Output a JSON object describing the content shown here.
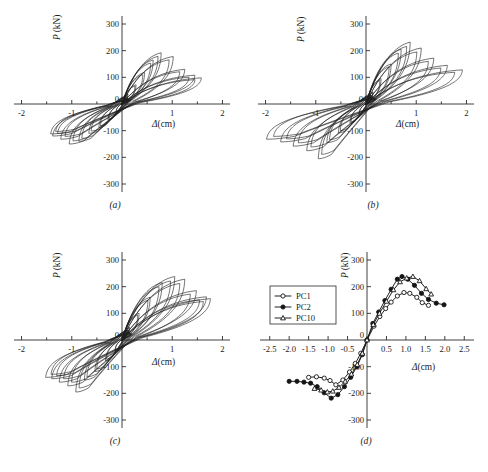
{
  "figure": {
    "background": "#ffffff",
    "ink_color": "#1a1a1a",
    "panels": [
      {
        "id": "a",
        "label": "(a)"
      },
      {
        "id": "b",
        "label": "(b)"
      },
      {
        "id": "c",
        "label": "(c)"
      },
      {
        "id": "d",
        "label": "(d)"
      }
    ]
  },
  "axes": {
    "y_title_symbol": "P",
    "y_title_unit": "(kN)",
    "x_title_symbol": "Δ",
    "x_title_unit": "(cm)",
    "hysteresis": {
      "x_ticks": [
        "-2",
        "-1",
        "0",
        "1",
        "2"
      ],
      "x_tick_values": [
        -2,
        -1,
        0,
        1,
        2
      ],
      "x_minor_values": [
        -1.5,
        -0.5,
        0.5,
        1.5
      ],
      "y_ticks": [
        "300",
        "200",
        "100",
        "0",
        "-100",
        "-200",
        "-300"
      ],
      "y_tick_values": [
        300,
        200,
        100,
        0,
        -100,
        -200,
        -300
      ],
      "xlim": [
        -2.15,
        2.15
      ],
      "ylim": [
        -330,
        330
      ]
    },
    "skeleton": {
      "x_ticks": [
        "-2.5",
        "-2.0",
        "-1.5",
        "-1.0",
        "-0.5",
        "0",
        "0.5",
        "1.0",
        "1.5",
        "2.0",
        "2.5"
      ],
      "x_tick_values": [
        -2.5,
        -2.0,
        -1.5,
        -1.0,
        -0.5,
        0,
        0.5,
        1.0,
        1.5,
        2.0,
        2.5
      ],
      "y_ticks": [
        "300",
        "200",
        "100",
        "0",
        "-100",
        "-200",
        "-300"
      ],
      "y_tick_values": [
        300,
        200,
        100,
        0,
        -100,
        -200,
        -300
      ],
      "xlim": [
        -2.75,
        2.75
      ],
      "ylim": [
        -330,
        330
      ]
    }
  },
  "chart_data": [
    {
      "type": "line",
      "panel": "a",
      "title": "(a)",
      "xlabel": "Δ(cm)",
      "ylabel": "P (kN)",
      "xlim": [
        -2.15,
        2.15
      ],
      "ylim": [
        -330,
        330
      ],
      "grid": false,
      "legend": "none",
      "description": "Load-displacement hysteresis loops, specimen PC1",
      "loops": [
        {
          "cycle": 1,
          "peak_pos": [
            0.12,
            38
          ],
          "peak_neg": [
            -0.12,
            -32
          ]
        },
        {
          "cycle": 2,
          "peak_pos": [
            0.28,
            72
          ],
          "peak_neg": [
            -0.28,
            -60
          ]
        },
        {
          "cycle": 3,
          "peak_pos": [
            0.45,
            118
          ],
          "peak_neg": [
            -0.46,
            -88
          ]
        },
        {
          "cycle": 4,
          "peak_pos": [
            0.62,
            165
          ],
          "peak_neg": [
            -0.66,
            -110
          ]
        },
        {
          "cycle": 5,
          "peak_pos": [
            0.78,
            192
          ],
          "peak_neg": [
            -0.86,
            -140
          ]
        },
        {
          "cycle": 6,
          "peak_pos": [
            1.02,
            178
          ],
          "peak_neg": [
            -1.05,
            -150
          ]
        },
        {
          "cycle": 7,
          "peak_pos": [
            1.25,
            130
          ],
          "peak_neg": [
            -1.22,
            -132
          ]
        },
        {
          "cycle": 8,
          "peak_pos": [
            1.45,
            108
          ],
          "peak_neg": [
            -1.38,
            -120
          ]
        },
        {
          "cycle": 9,
          "peak_pos": [
            1.58,
            98
          ],
          "peak_neg": [
            -1.42,
            -112
          ]
        }
      ]
    },
    {
      "type": "line",
      "panel": "b",
      "title": "(b)",
      "xlabel": "Δ(cm)",
      "ylabel": "P (kN)",
      "xlim": [
        -2.15,
        2.15
      ],
      "ylim": [
        -330,
        330
      ],
      "grid": false,
      "legend": "none",
      "description": "Load-displacement hysteresis loops, specimen PC2",
      "loops": [
        {
          "cycle": 1,
          "peak_pos": [
            0.14,
            45
          ],
          "peak_neg": [
            -0.14,
            -40
          ]
        },
        {
          "cycle": 2,
          "peak_pos": [
            0.3,
            95
          ],
          "peak_neg": [
            -0.32,
            -72
          ]
        },
        {
          "cycle": 3,
          "peak_pos": [
            0.5,
            150
          ],
          "peak_neg": [
            -0.55,
            -108
          ]
        },
        {
          "cycle": 4,
          "peak_pos": [
            0.7,
            205
          ],
          "peak_neg": [
            -0.78,
            -145
          ]
        },
        {
          "cycle": 5,
          "peak_pos": [
            0.88,
            232
          ],
          "peak_neg": [
            -0.95,
            -205
          ]
        },
        {
          "cycle": 6,
          "peak_pos": [
            1.1,
            210
          ],
          "peak_neg": [
            -1.18,
            -175
          ]
        },
        {
          "cycle": 7,
          "peak_pos": [
            1.35,
            172
          ],
          "peak_neg": [
            -1.45,
            -158
          ]
        },
        {
          "cycle": 8,
          "peak_pos": [
            1.62,
            145
          ],
          "peak_neg": [
            -1.7,
            -142
          ]
        },
        {
          "cycle": 9,
          "peak_pos": [
            1.92,
            128
          ],
          "peak_neg": [
            -1.98,
            -132
          ]
        }
      ]
    },
    {
      "type": "line",
      "panel": "c",
      "title": "(c)",
      "xlabel": "Δ(cm)",
      "ylabel": "P (kN)",
      "xlim": [
        -2.15,
        2.15
      ],
      "ylim": [
        -330,
        330
      ],
      "grid": false,
      "legend": "none",
      "description": "Load-displacement hysteresis loops, specimen PC10",
      "loops": [
        {
          "cycle": 1,
          "peak_pos": [
            0.15,
            48
          ],
          "peak_neg": [
            -0.14,
            -42
          ]
        },
        {
          "cycle": 2,
          "peak_pos": [
            0.34,
            100
          ],
          "peak_neg": [
            -0.33,
            -78
          ]
        },
        {
          "cycle": 3,
          "peak_pos": [
            0.56,
            160
          ],
          "peak_neg": [
            -0.54,
            -118
          ]
        },
        {
          "cycle": 4,
          "peak_pos": [
            0.8,
            215
          ],
          "peak_neg": [
            -0.75,
            -150
          ]
        },
        {
          "cycle": 5,
          "peak_pos": [
            1.05,
            238
          ],
          "peak_neg": [
            -0.92,
            -195
          ]
        },
        {
          "cycle": 6,
          "peak_pos": [
            1.25,
            228
          ],
          "peak_neg": [
            -1.08,
            -172
          ]
        },
        {
          "cycle": 7,
          "peak_pos": [
            1.48,
            185
          ],
          "peak_neg": [
            -1.25,
            -158
          ]
        },
        {
          "cycle": 8,
          "peak_pos": [
            1.68,
            162
          ],
          "peak_neg": [
            -1.4,
            -145
          ]
        },
        {
          "cycle": 9,
          "peak_pos": [
            1.76,
            155
          ],
          "peak_neg": [
            -1.52,
            -140
          ]
        }
      ]
    },
    {
      "type": "line",
      "panel": "d",
      "title": "(d)",
      "xlabel": "Δ(cm)",
      "ylabel": "P (kN)",
      "xlim": [
        -2.75,
        2.75
      ],
      "ylim": [
        -330,
        330
      ],
      "grid": false,
      "legend": "top-left",
      "description": "Skeleton (envelope) curves comparison of PC1, PC2 and PC10",
      "series": [
        {
          "name": "PC1",
          "marker": "open-circle",
          "x": [
            -1.5,
            -1.3,
            -1.1,
            -0.95,
            -0.8,
            -0.62,
            -0.45,
            -0.3,
            -0.16,
            0,
            0.18,
            0.33,
            0.48,
            0.62,
            0.78,
            0.95,
            1.1,
            1.28,
            1.42,
            1.58
          ],
          "y": [
            -140,
            -138,
            -143,
            -152,
            -168,
            -150,
            -120,
            -88,
            -50,
            0,
            52,
            88,
            118,
            142,
            165,
            178,
            175,
            160,
            140,
            130
          ]
        },
        {
          "name": "PC2",
          "marker": "filled-circle",
          "x": [
            -2.0,
            -1.8,
            -1.62,
            -1.45,
            -1.28,
            -1.1,
            -0.92,
            -0.75,
            -0.58,
            -0.42,
            -0.26,
            -0.12,
            0,
            0.15,
            0.3,
            0.46,
            0.62,
            0.78,
            0.9,
            1.05,
            1.22,
            1.4,
            1.58,
            1.78,
            1.98
          ],
          "y": [
            -155,
            -155,
            -158,
            -162,
            -175,
            -198,
            -218,
            -205,
            -175,
            -140,
            -100,
            -55,
            0,
            62,
            105,
            148,
            190,
            228,
            238,
            228,
            205,
            175,
            152,
            138,
            132
          ]
        },
        {
          "name": "PC10",
          "marker": "open-triangle",
          "x": [
            -1.35,
            -1.18,
            -1.02,
            -0.88,
            -0.72,
            -0.56,
            -0.4,
            -0.25,
            -0.12,
            0,
            0.16,
            0.32,
            0.5,
            0.68,
            0.85,
            1.02,
            1.18,
            1.35,
            1.52,
            1.65
          ],
          "y": [
            -182,
            -188,
            -195,
            -192,
            -178,
            -155,
            -128,
            -92,
            -50,
            0,
            58,
            100,
            145,
            188,
            218,
            232,
            238,
            222,
            192,
            172
          ]
        }
      ]
    }
  ],
  "legend": {
    "entries": [
      {
        "label": "PC1",
        "marker": "open-circle"
      },
      {
        "label": "PC2",
        "marker": "filled-circle"
      },
      {
        "label": "PC10",
        "marker": "open-triangle"
      }
    ]
  }
}
